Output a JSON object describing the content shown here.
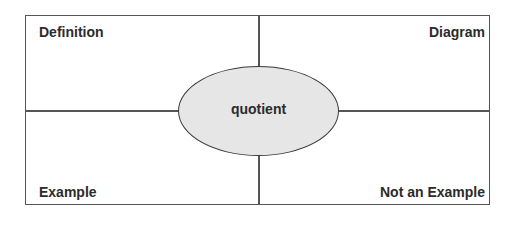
{
  "diagram": {
    "type": "frayer-model",
    "center_term": "quotient",
    "quadrants": {
      "top_left": {
        "label": "Definition"
      },
      "top_right": {
        "label": "Diagram"
      },
      "bottom_left": {
        "label": "Example"
      },
      "bottom_right": {
        "label": "Not an Example"
      }
    }
  },
  "colors": {
    "line": "#555555",
    "text": "#2b2b2b",
    "ellipse_fill": "#e6e6e6",
    "ellipse_stroke": "#3a3a3a",
    "background": "#ffffff"
  }
}
